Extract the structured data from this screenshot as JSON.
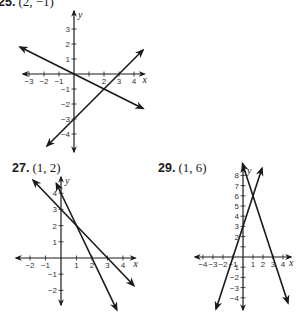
{
  "problems": [
    {
      "number": "25.",
      "answer": "(2, −1)",
      "label_pos": [
        -2,
        -6
      ],
      "origin": [
        74,
        74
      ],
      "unit": [
        15,
        15
      ],
      "x_range": [
        -3.4,
        4.7
      ],
      "y_range": [
        -5.2,
        4.2
      ],
      "x_ticks": [
        -3,
        -2,
        -1,
        1,
        2,
        3,
        4
      ],
      "y_ticks": [
        -4,
        -3,
        -2,
        -1,
        1,
        2,
        3
      ],
      "x_tick_labels": [
        "−3",
        "−2",
        "−1",
        "",
        "2",
        "3",
        "4"
      ],
      "y_tick_labels": [
        "−4",
        "−3",
        "−2",
        "−1",
        "1",
        "2",
        "3"
      ],
      "x_axis_label": "x",
      "y_axis_label": "y",
      "lines": [
        {
          "equation": "y = -x/2",
          "p1": [
            -3.6,
            1.8
          ],
          "p2": [
            4.6,
            -2.3
          ]
        },
        {
          "equation": "y = x - 3",
          "p1": [
            -1.8,
            -4.8
          ],
          "p2": [
            4.6,
            1.6
          ]
        }
      ]
    },
    {
      "number": "27.",
      "answer": "(1, 2)",
      "label_pos": [
        12,
        162
      ],
      "origin": [
        61,
        258
      ],
      "unit": [
        15.5,
        16.2
      ],
      "x_range": [
        -2.9,
        4.8
      ],
      "y_range": [
        -2.9,
        5.0
      ],
      "x_ticks": [
        -2,
        -1,
        1,
        2,
        3,
        4
      ],
      "y_ticks": [
        -2,
        -1,
        1,
        2,
        3,
        4
      ],
      "x_tick_labels": [
        "−2",
        "−1",
        "1",
        "2",
        "3",
        "4"
      ],
      "y_tick_labels": [
        "−2",
        "−1",
        "1",
        "2",
        "3",
        "4"
      ],
      "x_axis_label": "x",
      "y_axis_label": "y",
      "lines": [
        {
          "equation": "y = -x + 3",
          "p1": [
            -1.8,
            4.8
          ],
          "p2": [
            4.7,
            -1.7
          ]
        },
        {
          "equation": "y = -2x + 4",
          "p1": [
            -0.3,
            4.6
          ],
          "p2": [
            3.6,
            -3.2
          ]
        }
      ]
    },
    {
      "number": "29.",
      "answer": "(1, 6)",
      "label_pos": [
        158,
        162
      ],
      "origin": [
        243,
        257
      ],
      "unit": [
        10,
        10.2
      ],
      "x_range": [
        -4.8,
        4.8
      ],
      "y_range": [
        -5.2,
        8.8
      ],
      "x_ticks": [
        -4,
        -3,
        -2,
        -1,
        1,
        2,
        3,
        4
      ],
      "y_ticks": [
        -4,
        -3,
        -2,
        -1,
        1,
        2,
        3,
        4,
        5,
        6,
        7,
        8
      ],
      "x_tick_labels": [
        "−4",
        "−3",
        "−2",
        "−1",
        "1",
        "2",
        "3",
        "4"
      ],
      "y_tick_labels": [
        "−4",
        "−3",
        "−2",
        "1",
        "",
        "2",
        "3",
        "4",
        "5",
        "6",
        "7",
        "8"
      ],
      "x_axis_label": "x",
      "y_axis_label": "y",
      "lines": [
        {
          "equation": "y = 3x + 3",
          "p1": [
            -2.7,
            -5.1
          ],
          "p2": [
            1.9,
            8.7
          ]
        },
        {
          "equation": "y = -3x + 9",
          "p1": [
            -0.05,
            9.15
          ],
          "p2": [
            4.5,
            -4.5
          ]
        }
      ]
    }
  ]
}
